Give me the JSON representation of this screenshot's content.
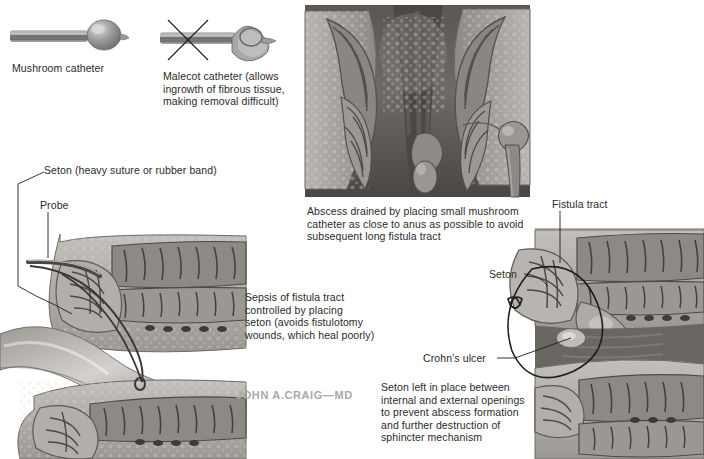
{
  "figure": {
    "signature": "JOHN A.CRAIG—MD",
    "background_color": "#ffffff",
    "text_color": "#2a2a2a"
  },
  "panels": {
    "catheters": {
      "mushroom": {
        "label": "Mushroom catheter",
        "icon": "mushroom-catheter-icon",
        "approved": true
      },
      "malecot": {
        "label": "Malecot catheter (allows\ningrowth of fibrous tissue,\nmaking removal difficult)",
        "icon": "malecot-catheter-icon",
        "approved": false,
        "mark": "x-cross-mark"
      }
    },
    "top_center": {
      "caption": "Abscess drained by placing small mushroom\ncatheter as close to anus as possible to avoid\nsubsequent long fistula tract",
      "art_name": "anal-canal-abscess-drainage-illustration"
    },
    "left_lower": {
      "labels": [
        {
          "name": "seton-label",
          "text": "Seton (heavy suture or rubber band)"
        },
        {
          "name": "probe-label",
          "text": "Probe"
        }
      ],
      "caption": "Sepsis of fistula tract\ncontrolled by placing\nseton (avoids fistulotomy\nwounds, which heal poorly)",
      "art_name": "fistula-tract-seton-probe-illustration"
    },
    "right_lower": {
      "labels": [
        {
          "name": "fistula-tract-label",
          "text": "Fistula tract"
        },
        {
          "name": "seton-loop-label",
          "text": "Seton"
        },
        {
          "name": "crohns-ulcer-label",
          "text": "Crohn’s ulcer"
        }
      ],
      "caption": "Seton left in place between\ninternal and external openings\nto prevent abscess formation\nand further destruction of\nsphincter mechanism",
      "art_name": "seton-in-place-sphincter-illustration"
    }
  }
}
